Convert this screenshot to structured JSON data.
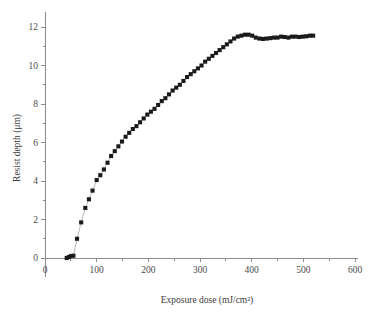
{
  "chart_data": {
    "type": "scatter",
    "title": "",
    "xlabel": "Exposure dose (mJ/cm²)",
    "ylabel": "Resist depth (μm)",
    "xlim": [
      0,
      600
    ],
    "ylim": [
      -1.0,
      12.8
    ],
    "xticks": [
      0,
      100,
      200,
      300,
      400,
      500,
      600
    ],
    "xtick_labels": [
      "0",
      "100",
      "200",
      "300",
      "400",
      "500",
      "600"
    ],
    "yticks": [
      0,
      2,
      4,
      6,
      8,
      10,
      12
    ],
    "ytick_labels": [
      "0",
      "2",
      "4",
      "6",
      "8",
      "10",
      "12"
    ],
    "x_minor_interval": 50,
    "y_minor_interval": 1,
    "grid": false,
    "legend": null,
    "marker": "square",
    "marker_color": "#1a1a1a",
    "line_color": "#9a9a9a",
    "series": [
      {
        "name": "Resist depth vs exposure dose",
        "x": [
          42,
          46,
          50,
          55,
          62,
          70,
          78,
          85,
          92,
          100,
          107,
          114,
          121,
          128,
          135,
          142,
          149,
          156,
          163,
          170,
          177,
          184,
          191,
          198,
          205,
          212,
          219,
          226,
          233,
          240,
          247,
          254,
          261,
          268,
          275,
          282,
          289,
          296,
          303,
          310,
          317,
          324,
          331,
          338,
          345,
          352,
          359,
          366,
          373,
          380,
          387,
          394,
          401,
          408,
          415,
          422,
          429,
          436,
          443,
          450,
          457,
          464,
          471,
          478,
          485,
          492,
          499,
          506,
          513,
          519
        ],
        "y": [
          0.0,
          0.05,
          0.1,
          0.12,
          1.0,
          1.85,
          2.6,
          3.05,
          3.5,
          4.05,
          4.3,
          4.6,
          4.95,
          5.3,
          5.55,
          5.8,
          6.05,
          6.3,
          6.5,
          6.7,
          6.85,
          7.05,
          7.25,
          7.45,
          7.6,
          7.75,
          7.95,
          8.15,
          8.3,
          8.5,
          8.7,
          8.85,
          9.0,
          9.2,
          9.4,
          9.55,
          9.7,
          9.85,
          10.0,
          10.2,
          10.35,
          10.5,
          10.65,
          10.8,
          10.95,
          11.1,
          11.25,
          11.4,
          11.5,
          11.55,
          11.6,
          11.6,
          11.55,
          11.45,
          11.4,
          11.38,
          11.4,
          11.42,
          11.45,
          11.45,
          11.5,
          11.48,
          11.45,
          11.5,
          11.5,
          11.48,
          11.5,
          11.52,
          11.55,
          11.55
        ]
      }
    ]
  }
}
